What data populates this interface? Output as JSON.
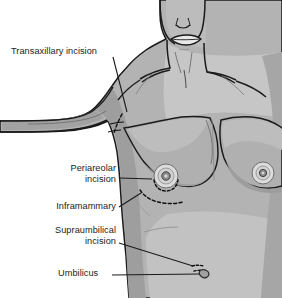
{
  "figure": {
    "style": "grayscale medical line illustration",
    "background_color": "#ffffff",
    "outline_color": "#1a1a1a",
    "skin_fill_color": "#b3b3b3",
    "skin_highlight_color": "#c9c9c9",
    "skin_shadow_color": "#9a9a9a",
    "areola_fill_color": "#dcdcdc",
    "nipple_color": "#8f8f8f",
    "incision_marking_color": "#111111",
    "label_text_color": "#1c1c1c",
    "leader_line_color": "#1a1a1a"
  },
  "labels": {
    "transaxillary": {
      "text": "Transaxillary incision",
      "lines": [
        "Transaxillary incision"
      ],
      "align": "left",
      "target": "axilla-dashed-incision"
    },
    "periareolar": {
      "text": "Periareolar incision",
      "lines": [
        "Periareolar",
        "incision"
      ],
      "align": "right",
      "target": "areola-dashed-arc"
    },
    "inframammary": {
      "text": "Inframammary",
      "lines": [
        "Inframammary"
      ],
      "align": "right",
      "target": "inframammary-fold-dashed-line"
    },
    "supraumbilical": {
      "text": "Supraumbilical incision",
      "lines": [
        "Supraumbilical",
        "incision"
      ],
      "align": "right",
      "target": "supraumbilical-dashed-mark"
    },
    "umbilicus": {
      "text": "Umbilicus",
      "lines": [
        "Umbilicus"
      ],
      "align": "left",
      "target": "navel"
    }
  },
  "anatomy": {
    "features": [
      "chin",
      "lips",
      "nose-tip",
      "neck",
      "clavicles",
      "sternal-notch",
      "raised-left-arm",
      "left-breast",
      "right-breast",
      "abdomen",
      "navel"
    ]
  }
}
